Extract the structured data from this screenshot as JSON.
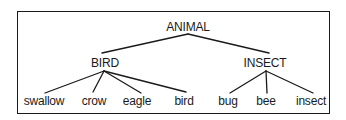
{
  "diagram": {
    "type": "tree",
    "root": {
      "label": "ANIMAL",
      "children": [
        {
          "label": "BIRD",
          "children": [
            {
              "label": "swallow"
            },
            {
              "label": "crow"
            },
            {
              "label": "eagle"
            },
            {
              "label": "bird"
            }
          ]
        },
        {
          "label": "INSECT",
          "children": [
            {
              "label": "bug"
            },
            {
              "label": "bee"
            },
            {
              "label": "insect"
            }
          ]
        }
      ]
    },
    "colors": {
      "line": "#1a1a1a",
      "text": "#1a1a1a",
      "background": "#ffffff"
    }
  },
  "nodes": {
    "animal": "ANIMAL",
    "bird_category": "BIRD",
    "insect_category": "INSECT",
    "swallow": "swallow",
    "crow": "crow",
    "eagle": "eagle",
    "bird_leaf": "bird",
    "bug": "bug",
    "bee": "bee",
    "insect_leaf": "insect"
  }
}
